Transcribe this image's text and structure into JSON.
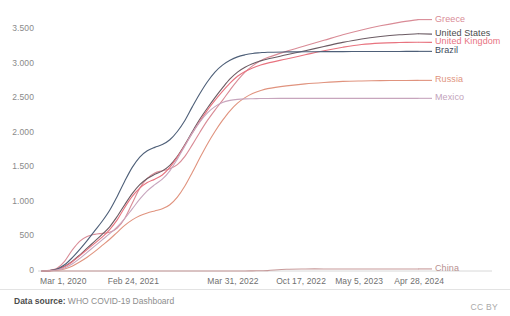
{
  "footer": {
    "source_prefix": "Data source:",
    "source_name": " WHO COVID-19 Dashboard",
    "license": "CC BY"
  },
  "chart_data": {
    "type": "line",
    "title": "",
    "subtitle": "",
    "xlabel": "",
    "ylabel": "",
    "grid": false,
    "legend_position": "right-inline-end-labels",
    "ylim": [
      0,
      3750
    ],
    "ytick_labels": [
      "0",
      "500",
      "1.000",
      "1.500",
      "2.000",
      "2.500",
      "3.000",
      "3.500"
    ],
    "ytick_values": [
      0,
      500,
      1000,
      1500,
      2000,
      2500,
      3000,
      3500
    ],
    "xtick_labels": [
      "Mar 1, 2020",
      "Feb 24, 2021",
      "Mar 31, 2022",
      "Oct 17, 2022",
      "May 5, 2023",
      "Apr 28, 2024"
    ],
    "xtick_positions": [
      0,
      0.18,
      0.445,
      0.628,
      0.785,
      0.942
    ],
    "x": [
      0,
      0.02,
      0.04,
      0.06,
      0.08,
      0.1,
      0.12,
      0.14,
      0.16,
      0.18,
      0.2,
      0.22,
      0.24,
      0.26,
      0.28,
      0.3,
      0.32,
      0.34,
      0.36,
      0.38,
      0.4,
      0.42,
      0.44,
      0.46,
      0.48,
      0.5,
      0.52,
      0.54,
      0.56,
      0.58,
      0.6,
      0.65,
      0.7,
      0.75,
      0.8,
      0.85,
      0.9,
      0.95,
      1.0
    ],
    "series": [
      {
        "name": "Greece",
        "color": "#d98b96",
        "label_color": "#d98b96",
        "label_y_value": 3640,
        "values": [
          0,
          10,
          40,
          140,
          300,
          430,
          500,
          530,
          545,
          560,
          620,
          760,
          980,
          1200,
          1340,
          1420,
          1450,
          1480,
          1540,
          1660,
          1830,
          2010,
          2180,
          2330,
          2470,
          2620,
          2760,
          2880,
          2970,
          3040,
          3090,
          3180,
          3260,
          3340,
          3420,
          3490,
          3550,
          3600,
          3640
        ]
      },
      {
        "name": "United States",
        "color": "#6b5b63",
        "label_color": "#4a4a4a",
        "label_y_value": 3430,
        "values": [
          0,
          5,
          25,
          70,
          140,
          230,
          330,
          430,
          530,
          640,
          790,
          960,
          1120,
          1250,
          1340,
          1400,
          1450,
          1530,
          1660,
          1830,
          2020,
          2200,
          2360,
          2510,
          2650,
          2780,
          2880,
          2950,
          3000,
          3040,
          3070,
          3130,
          3190,
          3250,
          3310,
          3360,
          3395,
          3420,
          3435
        ]
      },
      {
        "name": "United Kingdom",
        "color": "#e8737f",
        "label_color": "#e8737f",
        "label_y_value": 3310,
        "values": [
          0,
          4,
          20,
          60,
          130,
          220,
          310,
          400,
          490,
          600,
          740,
          920,
          1080,
          1200,
          1280,
          1330,
          1390,
          1500,
          1650,
          1820,
          2000,
          2170,
          2330,
          2470,
          2600,
          2720,
          2820,
          2890,
          2940,
          2980,
          3010,
          3070,
          3130,
          3190,
          3240,
          3280,
          3300,
          3308,
          3312
        ]
      },
      {
        "name": "Brazil",
        "color": "#4e5f78",
        "label_color": "#3d4a5c",
        "label_y_value": 3180,
        "values": [
          0,
          6,
          30,
          90,
          190,
          310,
          440,
          580,
          720,
          880,
          1080,
          1300,
          1500,
          1650,
          1740,
          1790,
          1830,
          1900,
          2020,
          2180,
          2380,
          2570,
          2740,
          2880,
          2980,
          3050,
          3100,
          3130,
          3150,
          3160,
          3168,
          3172,
          3174,
          3176,
          3177,
          3178,
          3179,
          3179,
          3180
        ]
      },
      {
        "name": "Russia",
        "color": "#e0937e",
        "label_color": "#e0937e",
        "label_y_value": 2760,
        "values": [
          0,
          2,
          10,
          30,
          70,
          130,
          200,
          280,
          370,
          460,
          560,
          660,
          740,
          800,
          840,
          870,
          900,
          960,
          1070,
          1230,
          1430,
          1640,
          1840,
          2020,
          2180,
          2320,
          2430,
          2510,
          2570,
          2610,
          2640,
          2680,
          2710,
          2730,
          2745,
          2752,
          2756,
          2758,
          2760
        ]
      },
      {
        "name": "Mexico",
        "color": "#c7a5bd",
        "label_color": "#c2a3bc",
        "label_y_value": 2500,
        "values": [
          0,
          3,
          15,
          45,
          100,
          180,
          270,
          360,
          450,
          540,
          640,
          760,
          900,
          1040,
          1160,
          1250,
          1330,
          1450,
          1620,
          1810,
          2000,
          2160,
          2290,
          2380,
          2440,
          2470,
          2485,
          2492,
          2495,
          2497,
          2498,
          2499,
          2499,
          2500,
          2500,
          2500,
          2500,
          2500,
          2500
        ]
      },
      {
        "name": "China",
        "color": "#c79a9a",
        "label_color": "#b79090",
        "label_y_value": 30,
        "values": [
          0,
          0,
          0,
          0,
          0,
          0,
          0,
          0,
          0,
          0,
          0,
          0,
          0,
          0,
          0,
          0,
          0,
          0,
          0,
          0,
          0,
          0,
          0,
          0,
          0,
          0,
          0,
          0,
          2,
          4,
          6,
          26,
          30,
          30,
          30,
          30,
          30,
          30,
          30
        ]
      }
    ]
  }
}
